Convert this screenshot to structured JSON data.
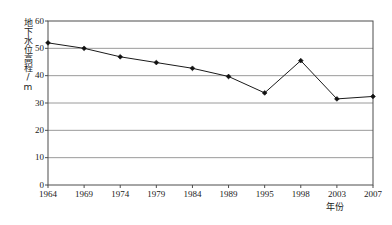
{
  "chart_data": {
    "type": "line",
    "title": "",
    "subtitle": "",
    "xlabel": "年份",
    "ylabel": "地下水位高程/m",
    "categories": [
      "1964",
      "1969",
      "1974",
      "1979",
      "1984",
      "1989",
      "1995",
      "1998",
      "2003",
      "2007"
    ],
    "values": [
      52.0,
      50.0,
      46.9,
      44.8,
      42.7,
      39.7,
      33.7,
      45.5,
      31.5,
      32.4
    ],
    "series": [
      {
        "name": "地下水位高程",
        "values": [
          52.0,
          50.0,
          46.9,
          44.8,
          42.7,
          39.7,
          33.7,
          45.5,
          31.5,
          32.4
        ]
      }
    ],
    "ylim": [
      0,
      60
    ],
    "yticks": [
      0,
      10,
      20,
      30,
      40,
      50,
      60
    ],
    "ytick_labels": [
      "0",
      "10",
      "20",
      "30",
      "40",
      "50",
      "60"
    ],
    "grid": "horizontal",
    "legend": "none",
    "marker": "diamond",
    "line_color": "#1a1a1a",
    "marker_color": "#111111",
    "grid_color": "#808080",
    "axis_color": "#4d4d4d",
    "background_color": "#ffffff"
  }
}
